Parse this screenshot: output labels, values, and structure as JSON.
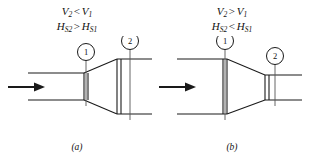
{
  "figure": {
    "background_color": "#ffffff",
    "line_color": "#1a1a1a",
    "text_color": "#111111"
  },
  "panels": [
    {
      "id": "a",
      "caption": "(a)",
      "device": "diffuser",
      "equations": [
        {
          "lhs": "V",
          "lhs_sub": "2",
          "relation": "<",
          "rhs": "V",
          "rhs_sub": "1"
        },
        {
          "lhs": "H",
          "lhs_sub": "S2",
          "relation": ">",
          "rhs": "H",
          "rhs_sub": "S1"
        }
      ],
      "stations": [
        {
          "label": "1",
          "position": "inlet"
        },
        {
          "label": "2",
          "position": "outlet"
        }
      ],
      "flow_arrow": "flow-arrow-right"
    },
    {
      "id": "b",
      "caption": "(b)",
      "device": "nozzle",
      "equations": [
        {
          "lhs": "V",
          "lhs_sub": "2",
          "relation": ">",
          "rhs": "V",
          "rhs_sub": "1"
        },
        {
          "lhs": "H",
          "lhs_sub": "S2",
          "relation": "<",
          "rhs": "H",
          "rhs_sub": "S1"
        }
      ],
      "stations": [
        {
          "label": "1",
          "position": "inlet"
        },
        {
          "label": "2",
          "position": "outlet"
        }
      ],
      "flow_arrow": "flow-arrow-right"
    }
  ]
}
